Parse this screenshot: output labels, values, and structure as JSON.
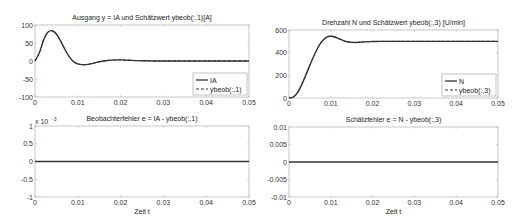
{
  "chart_data": [
    {
      "type": "line",
      "title": "Ausgang y = IA und Schätzwert ybeob(:,1)[A]",
      "xlabel": "",
      "ylabel": "",
      "xlim": [
        0,
        0.05
      ],
      "ylim": [
        -100,
        100
      ],
      "xticks": [
        0,
        0.01,
        0.02,
        0.03,
        0.04,
        0.05
      ],
      "xtick_labels": [
        "0",
        "0.01",
        "0.02",
        "0.03",
        "0.04",
        "0.05"
      ],
      "yticks": [
        -100,
        -50,
        0,
        50,
        100
      ],
      "ytick_labels": [
        "-100",
        "-50",
        "0",
        "50",
        "100"
      ],
      "exponent_label": "",
      "grid": false,
      "legend_position": "bottom-right",
      "series": [
        {
          "name": "IA",
          "style": "solid",
          "x": [
            0,
            0.001,
            0.002,
            0.003,
            0.004,
            0.005,
            0.006,
            0.007,
            0.008,
            0.009,
            0.01,
            0.011,
            0.012,
            0.013,
            0.014,
            0.015,
            0.016,
            0.017,
            0.018,
            0.019,
            0.02,
            0.022,
            0.024,
            0.026,
            0.028,
            0.03,
            0.035,
            0.04,
            0.045,
            0.05
          ],
          "y": [
            0,
            22,
            58,
            80,
            84,
            75,
            55,
            32,
            12,
            -2,
            -8,
            -10,
            -10,
            -8,
            -5,
            -2,
            0,
            1.5,
            2.5,
            3,
            3,
            2,
            1,
            0.5,
            0,
            0,
            0,
            0,
            0,
            0
          ]
        },
        {
          "name": "ybeob(:,1)",
          "style": "dashed",
          "x": [
            0,
            0.001,
            0.002,
            0.003,
            0.004,
            0.005,
            0.006,
            0.007,
            0.008,
            0.009,
            0.01,
            0.011,
            0.012,
            0.013,
            0.014,
            0.015,
            0.016,
            0.017,
            0.018,
            0.019,
            0.02,
            0.022,
            0.024,
            0.026,
            0.028,
            0.03,
            0.035,
            0.04,
            0.045,
            0.05
          ],
          "y": [
            0,
            22,
            58,
            80,
            84,
            75,
            55,
            32,
            12,
            -2,
            -8,
            -10,
            -10,
            -8,
            -5,
            -2,
            0,
            1.5,
            2.5,
            3,
            3,
            2,
            1,
            0.5,
            0,
            0,
            0,
            0,
            0,
            0
          ]
        }
      ]
    },
    {
      "type": "line",
      "title": "Drehzahl N und Schätzwert ybeob(:,3) [U/min]",
      "xlabel": "",
      "ylabel": "",
      "xlim": [
        0,
        0.05
      ],
      "ylim": [
        0,
        600
      ],
      "xticks": [
        0,
        0.01,
        0.02,
        0.03,
        0.04,
        0.05
      ],
      "xtick_labels": [
        "0",
        "0.01",
        "0.02",
        "0.03",
        "0.04",
        "0.05"
      ],
      "yticks": [
        0,
        200,
        400,
        600
      ],
      "ytick_labels": [
        "0",
        "200",
        "400",
        "600"
      ],
      "exponent_label": "",
      "grid": false,
      "legend_position": "bottom-right",
      "series": [
        {
          "name": "N",
          "style": "solid",
          "x": [
            0,
            0.001,
            0.002,
            0.003,
            0.004,
            0.005,
            0.006,
            0.007,
            0.008,
            0.009,
            0.01,
            0.011,
            0.012,
            0.013,
            0.014,
            0.015,
            0.016,
            0.017,
            0.018,
            0.02,
            0.022,
            0.025,
            0.03,
            0.035,
            0.04,
            0.045,
            0.05
          ],
          "y": [
            0,
            8,
            45,
            115,
            200,
            290,
            375,
            450,
            505,
            538,
            545,
            538,
            522,
            507,
            496,
            491,
            490,
            492,
            495,
            498,
            500,
            500,
            500,
            500,
            500,
            500,
            500
          ]
        },
        {
          "name": "ybeob(:,3)",
          "style": "dashed",
          "x": [
            0,
            0.001,
            0.002,
            0.003,
            0.004,
            0.005,
            0.006,
            0.007,
            0.008,
            0.009,
            0.01,
            0.011,
            0.012,
            0.013,
            0.014,
            0.015,
            0.016,
            0.017,
            0.018,
            0.02,
            0.022,
            0.025,
            0.03,
            0.035,
            0.04,
            0.045,
            0.05
          ],
          "y": [
            0,
            8,
            45,
            115,
            200,
            290,
            375,
            450,
            505,
            538,
            545,
            538,
            522,
            507,
            496,
            491,
            490,
            492,
            495,
            498,
            500,
            500,
            500,
            500,
            500,
            500,
            500
          ]
        }
      ]
    },
    {
      "type": "line",
      "title": "Beobachterfehler e = IA - ybeob(:,1)",
      "xlabel": "Zeit t",
      "ylabel": "",
      "xlim": [
        0,
        0.05
      ],
      "ylim": [
        -0.001,
        0.001
      ],
      "xticks": [
        0,
        0.01,
        0.02,
        0.03,
        0.04,
        0.05
      ],
      "xtick_labels": [
        "0",
        "0.01",
        "0.02",
        "0.03",
        "0.04",
        "0.05"
      ],
      "yticks": [
        -0.001,
        -0.0005,
        0,
        0.0005,
        0.001
      ],
      "ytick_labels": [
        "-1",
        "-0.5",
        "0",
        "0.5",
        "1"
      ],
      "exponent_label": "x 10",
      "exponent_power": "-3",
      "grid": false,
      "legend_position": "none",
      "series": [
        {
          "name": "e",
          "style": "solid",
          "x": [
            0,
            0.05
          ],
          "y": [
            0,
            0
          ]
        }
      ]
    },
    {
      "type": "line",
      "title": "Schätzfehler e = N - ybeob(:,3)",
      "xlabel": "Zeit t",
      "ylabel": "",
      "xlim": [
        0,
        0.05
      ],
      "ylim": [
        -0.01,
        0.01
      ],
      "xticks": [
        0,
        0.01,
        0.02,
        0.03,
        0.04,
        0.05
      ],
      "xtick_labels": [
        "0",
        "0.01",
        "0.02",
        "0.03",
        "0.04",
        "0.05"
      ],
      "yticks": [
        -0.01,
        -0.005,
        0,
        0.005,
        0.01
      ],
      "ytick_labels": [
        "-0.01",
        "-0.005",
        "0",
        "0.005",
        "0.01"
      ],
      "exponent_label": "",
      "grid": false,
      "legend_position": "none",
      "series": [
        {
          "name": "e",
          "style": "solid",
          "x": [
            0,
            0.05
          ],
          "y": [
            0,
            0
          ]
        }
      ]
    }
  ]
}
